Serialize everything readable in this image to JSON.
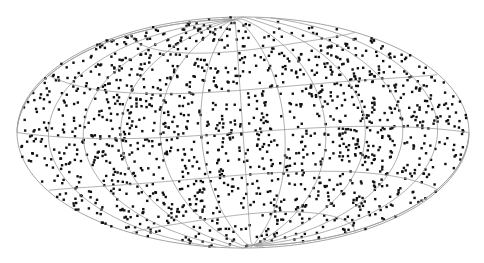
{
  "map": {
    "projection": "hammer-aitoff",
    "center": [
      243,
      132.5
    ],
    "rx": 226,
    "ry": 115.5,
    "graticule": {
      "meridian_step_deg": 30,
      "parallel_step_deg": 30,
      "color": "#9a9a9a"
    },
    "points": {
      "count": 1500,
      "color": "#111111",
      "size_px": 2.4,
      "distribution": "uniform on sphere",
      "seed": 7
    },
    "background": "#ffffff"
  }
}
